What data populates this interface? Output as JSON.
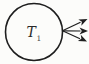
{
  "diagram": {
    "node": {
      "label": "T",
      "subscript": "1",
      "shape": "circle"
    },
    "arrows": {
      "count": 3,
      "direction": "fan-out-right",
      "style": "filled-stealth-heads"
    },
    "colors": {
      "stroke": "#1e1e1e",
      "background": "#fcfcfa",
      "label": "#2a2a2a"
    }
  }
}
